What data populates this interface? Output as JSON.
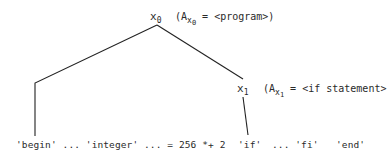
{
  "diagram": {
    "type": "parse-tree",
    "nodes": [
      {
        "id": "x0",
        "name": "x",
        "subscript": "0",
        "annotation": {
          "open": "(A",
          "sub_var": "x",
          "sub_index": "0",
          "eq": " = <program>)"
        }
      },
      {
        "id": "x1",
        "name": "x",
        "subscript": "1",
        "annotation": {
          "open": "(A",
          "sub_var": "x",
          "sub_index": "1",
          "eq": " = <if statement>"
        }
      }
    ],
    "edges": [
      {
        "from": "x0",
        "to": "leaf-left"
      },
      {
        "from": "x0",
        "to": "x1"
      },
      {
        "from": "x1",
        "to": "leaf-if"
      }
    ],
    "leaves": {
      "left_text": "'begin' ... 'integer' ... = 256 *+ 2",
      "if_text": "'if'",
      "ellipsis_fi_text": "... 'fi'",
      "end_text": "'end'"
    },
    "stroke_color": "#222222",
    "text_color": "#2a2a2a"
  }
}
